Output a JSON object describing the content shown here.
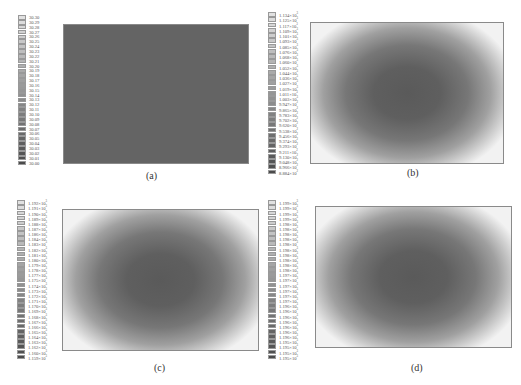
{
  "chart_data": [
    {
      "type": "heatmap",
      "panel": "(a)",
      "caption": "(a)",
      "description": "Uniform field",
      "legend_values": [
        "30.30",
        "30.29",
        "30.28",
        "30.27",
        "30.26",
        "30.25",
        "30.24",
        "30.23",
        "30.22",
        "30.21",
        "30.20",
        "30.19",
        "30.18",
        "30.17",
        "30.16",
        "30.15",
        "30.14",
        "30.13",
        "30.12",
        "30.11",
        "30.10",
        "30.09",
        "30.08",
        "30.07",
        "30.06",
        "30.05",
        "30.04",
        "30.03",
        "30.02",
        "30.01",
        "30.00"
      ],
      "range": [
        30.0,
        30.3
      ]
    },
    {
      "type": "heatmap",
      "panel": "(b)",
      "caption": "(b)",
      "description": "Low-value ellipse centered, high values at corners",
      "legend_values": [
        "1.134×10",
        "1.125×10",
        "1.117×10",
        "1.109×10",
        "1.101×10",
        "1.093×10",
        "1.085×10",
        "1.076×10",
        "1.068×10",
        "1.060×10",
        "1.052×10",
        "1.044×10",
        "1.036×10",
        "1.027×10",
        "1.019×10",
        "1.011×10",
        "1.003×10",
        "9.947×10",
        "9.865×10",
        "9.783×10",
        "9.702×10",
        "9.620×10",
        "9.538×10",
        "9.456×10",
        "9.374×10",
        "9.293×10",
        "9.211×10",
        "9.130×10",
        "9.048×10",
        "8.966×10",
        "8.884×10"
      ],
      "legend_exponents": [
        "3",
        "3",
        "3",
        "3",
        "3",
        "3",
        "3",
        "3",
        "3",
        "3",
        "3",
        "3",
        "3",
        "3",
        "3",
        "3",
        "3",
        "2",
        "2",
        "2",
        "2",
        "2",
        "2",
        "2",
        "2",
        "2",
        "2",
        "2",
        "2",
        "2",
        "2"
      ],
      "range": [
        888.4,
        1134
      ]
    },
    {
      "type": "heatmap",
      "panel": "(c)",
      "caption": "(c)",
      "description": "Low-value ellipse centered, high values at corners",
      "legend_values": [
        "1.192×10",
        "1.191×10",
        "1.190×10",
        "1.189×10",
        "1.188×10",
        "1.187×10",
        "1.186×10",
        "1.184×10",
        "1.183×10",
        "1.182×10",
        "1.181×10",
        "1.180×10",
        "1.179×10",
        "1.178×10",
        "1.177×10",
        "1.175×10",
        "1.174×10",
        "1.173×10",
        "1.172×10",
        "1.171×10",
        "1.170×10",
        "1.169×10",
        "1.168×10",
        "1.167×10",
        "1.166×10",
        "1.165×10",
        "1.164×10",
        "1.163×10",
        "1.162×10",
        "1.160×10",
        "1.159×10"
      ],
      "legend_exponents": [
        "3",
        "3",
        "3",
        "3",
        "3",
        "3",
        "3",
        "3",
        "3",
        "3",
        "3",
        "3",
        "3",
        "3",
        "3",
        "3",
        "3",
        "3",
        "3",
        "3",
        "3",
        "3",
        "3",
        "3",
        "3",
        "3",
        "3",
        "3",
        "3",
        "3",
        "3"
      ],
      "range": [
        1159,
        1192
      ]
    },
    {
      "type": "heatmap",
      "panel": "(d)",
      "caption": "(d)",
      "description": "Low-value ellipse centered, high values at corners",
      "legend_values": [
        "1.199×10",
        "1.199×10",
        "1.199×10",
        "1.199×10",
        "1.198×10",
        "1.198×10",
        "1.198×10",
        "1.198×10",
        "1.198×10",
        "1.198×10",
        "1.198×10",
        "1.198×10",
        "1.198×10",
        "1.198×10",
        "1.197×10",
        "1.197×10",
        "1.197×10",
        "1.197×10",
        "1.197×10",
        "1.197×10",
        "1.196×10",
        "1.196×10",
        "1.196×10",
        "1.196×10",
        "1.196×10",
        "1.196×10",
        "1.196×10",
        "1.195×10",
        "1.195×10",
        "1.195×10",
        "1.195×10"
      ],
      "legend_exponents": [
        "3",
        "3",
        "3",
        "3",
        "3",
        "3",
        "3",
        "3",
        "3",
        "3",
        "3",
        "3",
        "3",
        "3",
        "3",
        "3",
        "3",
        "3",
        "3",
        "3",
        "3",
        "3",
        "3",
        "3",
        "3",
        "3",
        "3",
        "3",
        "3",
        "3",
        "3"
      ],
      "range": [
        1195,
        1199
      ]
    }
  ],
  "captions": {
    "a": "(a)",
    "b": "(b)",
    "c": "(c)",
    "d": "(d)"
  }
}
